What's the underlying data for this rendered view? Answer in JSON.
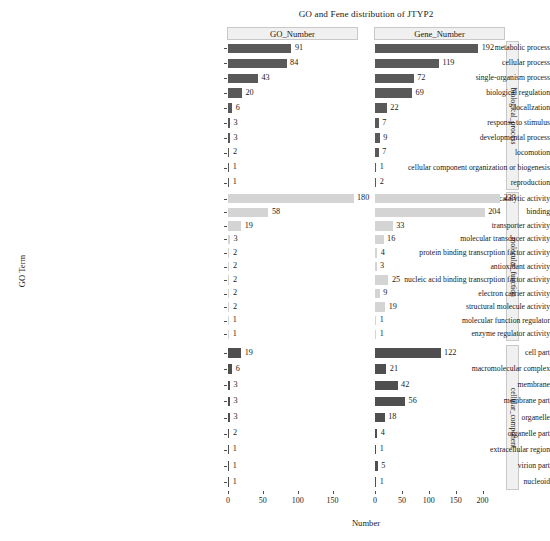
{
  "chart_data": {
    "type": "bar",
    "title": "GO and Fene distribution of JTYP2",
    "xlabel": "Number",
    "ylabel": "GO Term",
    "grid": false,
    "legend": "none",
    "orientation": "horizontal",
    "facet_columns": [
      "GO_Number",
      "Gene_Number"
    ],
    "facet_rows": [
      "biological_process",
      "molecular_function",
      "cellular_component"
    ],
    "axes": {
      "GO_Number": {
        "ticks": [
          0,
          50,
          100,
          150
        ],
        "xlim": [
          0,
          185
        ]
      },
      "Gene_Number": {
        "ticks": [
          0,
          50,
          100,
          150,
          200
        ],
        "xlim": [
          0,
          240
        ]
      }
    },
    "colors": {
      "biological_process": "#595959",
      "molecular_function": "#d4d4d4",
      "cellular_component": "#4f4f4f"
    },
    "groups": [
      {
        "name": "biological_process",
        "categories": [
          "metabolic process",
          "cellular process",
          "single-organism process",
          "biological regulation",
          "locallzation",
          "response to stimulus",
          "developmental process",
          "locomotion",
          "cellular component organization or biogenesis",
          "reproduction"
        ],
        "series": [
          {
            "name": "GO_Number",
            "values": [
              91,
              84,
              43,
              20,
              6,
              3,
              3,
              2,
              1,
              1
            ]
          },
          {
            "name": "Gene_Number",
            "values": [
              192,
              119,
              72,
              69,
              22,
              7,
              9,
              7,
              1,
              2
            ]
          }
        ]
      },
      {
        "name": "molecular_function",
        "categories": [
          "catalytic activity",
          "binding",
          "transporter activity",
          "molecular transducer activity",
          "protein binding transcrption factor activity",
          "antioxidant activity",
          "nucleic acid binding transcrption factor activity",
          "electron carrier activity",
          "structural molecule activity",
          "molecular function regulator",
          "enzyme regulator activity"
        ],
        "series": [
          {
            "name": "GO_Number",
            "values": [
              180,
              58,
              19,
              3,
              2,
              2,
              2,
              2,
              2,
              1,
              1
            ]
          },
          {
            "name": "Gene_Number",
            "values": [
              233,
              204,
              33,
              16,
              4,
              3,
              25,
              9,
              19,
              1,
              1
            ]
          }
        ]
      },
      {
        "name": "cellular_component",
        "categories": [
          "cell part",
          "macromolecular complex",
          "membrane",
          "membrane part",
          "organelle",
          "organelle part",
          "extracellular region",
          "virion part",
          "nucleoid"
        ],
        "series": [
          {
            "name": "GO_Number",
            "values": [
              19,
              6,
              3,
              3,
              3,
              2,
              1,
              1,
              1
            ]
          },
          {
            "name": "Gene_Number",
            "values": [
              122,
              21,
              42,
              56,
              18,
              4,
              1,
              5,
              1
            ]
          }
        ]
      }
    ]
  }
}
